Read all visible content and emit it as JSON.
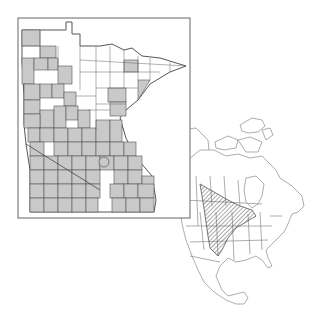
{
  "figure": {
    "type": "species distribution map",
    "panels": [
      {
        "name": "minnesota-county-map",
        "description": "Minnesota county outline map with occurrence counties shaded gray",
        "box": {
          "x": 18,
          "y": 18,
          "w": 172,
          "h": 200
        },
        "colors": {
          "shaded": "#c9c9c9",
          "unshaded": "#ffffff",
          "border": "#555555"
        }
      },
      {
        "name": "north-america-range-map",
        "description": "North America outline map with hatched range in central interior",
        "colors": {
          "outline": "#8a8a8a",
          "hatch": "#555555"
        }
      }
    ]
  },
  "colors": {
    "background": "#ffffff",
    "county_fill": "#c9c9c9",
    "line": "#666666"
  }
}
